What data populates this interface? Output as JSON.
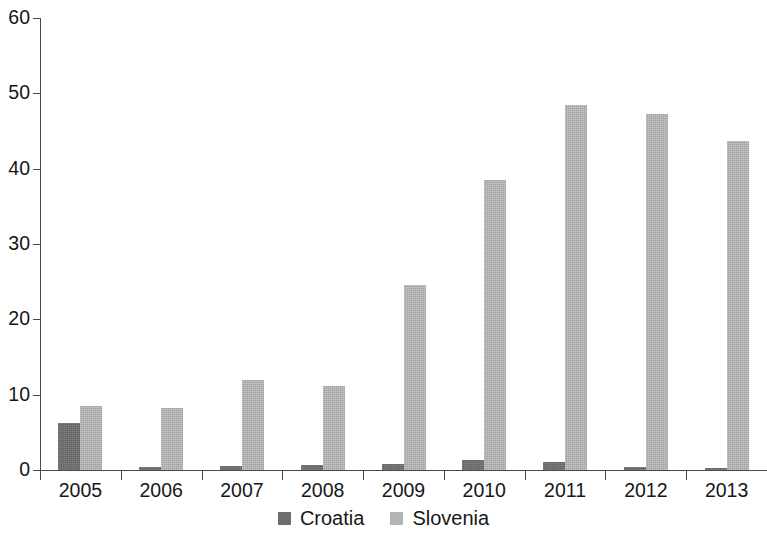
{
  "chart_data": {
    "type": "bar",
    "title": "",
    "subtitle": "",
    "xlabel": "",
    "ylabel": "",
    "categories": [
      "2005",
      "2006",
      "2007",
      "2008",
      "2009",
      "2010",
      "2011",
      "2012",
      "2013"
    ],
    "series": [
      {
        "name": "Croatia",
        "color": "#6e6e6e",
        "values": [
          6.3,
          0.35,
          0.5,
          0.65,
          0.75,
          1.3,
          1.0,
          0.35,
          0.3
        ]
      },
      {
        "name": "Slovenia",
        "color": "#b4b4b4",
        "values": [
          8.5,
          8.2,
          12.0,
          11.2,
          24.5,
          38.5,
          48.4,
          47.2,
          43.7
        ]
      }
    ],
    "ylim": [
      0,
      60
    ],
    "yticks": [
      0,
      10,
      20,
      30,
      40,
      50,
      60
    ],
    "ytick_labels": [
      "0",
      "10",
      "20",
      "30",
      "40",
      "50",
      "60"
    ],
    "grid": false,
    "legend_position": "bottom",
    "legend_entries": [
      "Croatia",
      "Slovenia"
    ],
    "annotations": []
  },
  "axis": {
    "axis_color": "#4a4a4a"
  }
}
